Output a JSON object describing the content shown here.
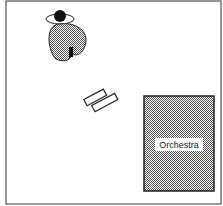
{
  "diagram": {
    "title": "",
    "elements": [
      {
        "id": "soloist",
        "type": "person-at-instrument"
      },
      {
        "id": "music-stand",
        "type": "music-stand"
      },
      {
        "id": "orchestra",
        "type": "region",
        "label": "Orchestra"
      }
    ],
    "colors": {
      "line": "#222222",
      "fill_pattern": "#555555",
      "background": "#ffffff",
      "label_bg": "#ffffff"
    }
  }
}
